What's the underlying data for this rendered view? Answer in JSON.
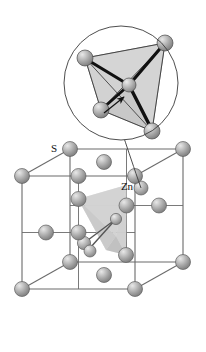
{
  "figure": {
    "labels": {
      "sulfur": "S",
      "zinc": "Zn"
    },
    "colors": {
      "background": "#ffffff",
      "atom_base": "#9a9a9a",
      "atom_mid": "#b4b4b4",
      "atom_highlight": "#e2e2e2",
      "atom_shadow": "#6e6e6e",
      "atom_outline": "#555555",
      "cell_edge": "#6b6b6b",
      "tetra_face_light": "#dadada",
      "tetra_face_mid": "#c6c6c6",
      "tetra_face_dark": "#b0b0b0",
      "bond_bold": "#111111",
      "circle_stroke": "#3a3a3a",
      "leader_line": "#3a3a3a",
      "label_text": "#111111"
    },
    "inset": {
      "name": "tetrahedral-coordination-inset",
      "shape": "circle",
      "center": {
        "x": 121,
        "y": 83
      },
      "radius": 57,
      "center_atom": {
        "x": 129,
        "y": 85,
        "r": 7
      },
      "vertex_atoms": [
        {
          "x": 85,
          "y": 58,
          "r": 8
        },
        {
          "x": 165,
          "y": 43,
          "r": 8
        },
        {
          "x": 101,
          "y": 110,
          "r": 8
        },
        {
          "x": 152,
          "y": 131,
          "r": 8
        }
      ],
      "bond_count": 4,
      "arrow": {
        "from": {
          "x": 104,
          "y": 112
        },
        "to": {
          "x": 125,
          "y": 96
        }
      }
    },
    "unit_cell": {
      "name": "zinc-blende-unit-cell",
      "front_face": {
        "x": 22,
        "y": 176,
        "w": 113,
        "h": 113
      },
      "depth": {
        "dx": 48,
        "dy": -27
      },
      "corner_atoms": 8,
      "face_center_atoms": 6,
      "interior_zn_atoms": 4,
      "tetrahedron_highlighted": true
    },
    "chemistry": {
      "compound": "ZnS",
      "structure_type": "zinc blende",
      "coordination_number": 4,
      "coordination_geometry": "tetrahedral"
    }
  }
}
